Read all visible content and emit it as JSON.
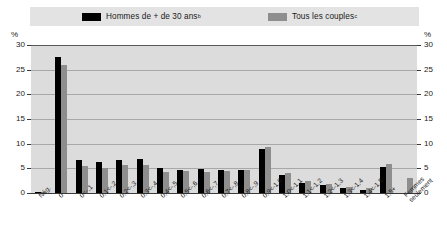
{
  "legend": {
    "items": [
      {
        "label": "Hommes de + de 30 ans",
        "note": "b",
        "color": "#000000",
        "icon": "legend-swatch-black"
      },
      {
        "label": "Tous les couples",
        "note": "c",
        "color": "#8e8e8e",
        "icon": "legend-swatch-gray"
      }
    ]
  },
  "axis": {
    "unit_left": "%",
    "unit_right": "%",
    "ticks": [
      "30",
      "25",
      "20",
      "15",
      "10",
      "5",
      "0"
    ]
  },
  "chart_data": {
    "type": "bar",
    "title": "",
    "xlabel": "",
    "ylabel": "%",
    "ylim": [
      0,
      30
    ],
    "ytick_values": [
      0,
      5,
      10,
      15,
      20,
      25,
      30
    ],
    "grid": true,
    "legend_position": "top",
    "categories": [
      "Nég.",
      "0",
      "0<-,1",
      "0,1<-,2",
      "0,2<-,3",
      "0,3<-,4",
      "0,4<-,5",
      "0,5<-,6",
      "0,6<-,7",
      "0,7<-,8",
      "0,8<-,9",
      "0,9<-1,0",
      "1,0<-1,1",
      "1,1<-1,2",
      "1,2<-1,3",
      "1,3<-1,4",
      "1,4<-1,5",
      "1,5+",
      "Femmes seulement"
    ],
    "series": [
      {
        "name": "Hommes de + de 30 ans",
        "color": "#000000",
        "values": [
          0.2,
          27.5,
          6.6,
          6.3,
          6.6,
          6.9,
          5.1,
          4.6,
          4.8,
          4.7,
          4.6,
          8.9,
          3.6,
          2.1,
          1.6,
          1.1,
          0.7,
          5.2,
          0.0
        ]
      },
      {
        "name": "Tous les couples",
        "color": "#8e8e8e",
        "values": [
          0.2,
          26.0,
          5.5,
          5.0,
          5.6,
          5.6,
          4.3,
          4.5,
          4.2,
          4.4,
          4.6,
          9.3,
          4.1,
          2.4,
          1.8,
          1.3,
          1.0,
          5.8,
          3.0
        ]
      }
    ]
  }
}
